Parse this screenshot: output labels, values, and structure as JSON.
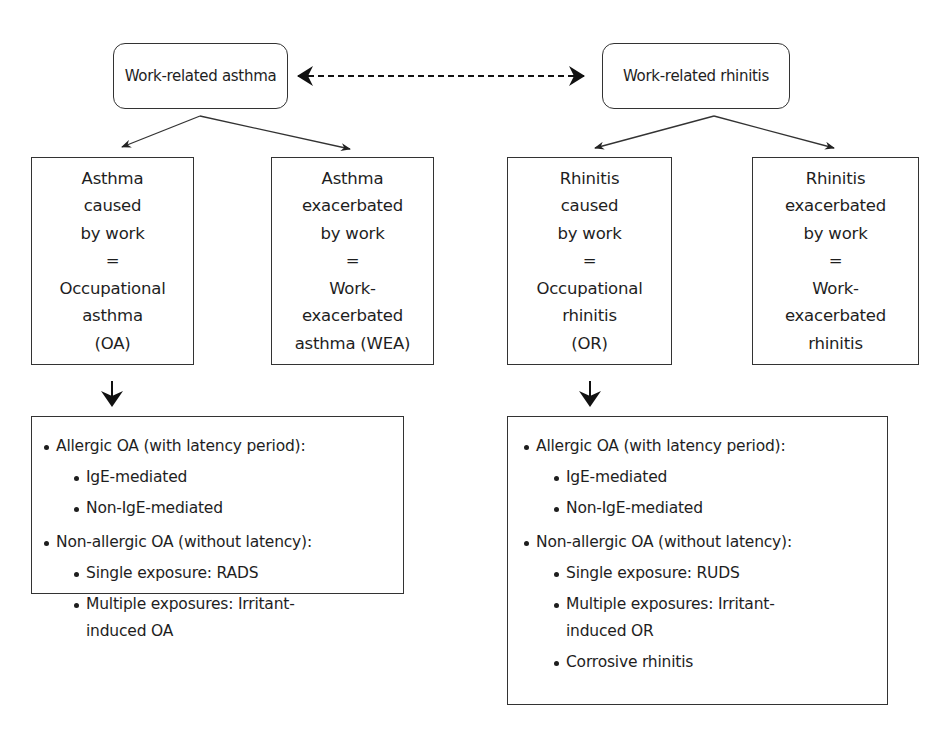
{
  "diagram": {
    "top_nodes": {
      "asthma": "Work-related asthma",
      "rhinitis": "Work-related rhinitis",
      "connector": "bidirectional-dashed-arrow"
    },
    "asthma_branches": {
      "caused": [
        "Asthma",
        "caused",
        "by work",
        "=",
        "Occupational",
        "asthma",
        "(OA)"
      ],
      "exacerbated": [
        "Asthma",
        "exacerbated",
        "by work",
        "=",
        "Work-",
        "exacerbated",
        "asthma (WEA)"
      ]
    },
    "rhinitis_branches": {
      "caused": [
        "Rhinitis",
        "caused",
        "by work",
        "=",
        "Occupational",
        "rhinitis",
        "(OR)"
      ],
      "exacerbated": [
        "Rhinitis",
        "exacerbated",
        "by work",
        "=",
        "Work-",
        "exacerbated",
        "rhinitis"
      ]
    },
    "asthma_subtypes": {
      "allergic": "Allergic OA (with latency period):",
      "allergic_items": [
        "IgE-mediated",
        "Non-IgE-mediated"
      ],
      "nonallergic": "Non-allergic OA (without latency):",
      "nonallergic_items": [
        "Single exposure: RADS",
        "Multiple exposures: Irritant-",
        "induced OA"
      ]
    },
    "rhinitis_subtypes": {
      "allergic": "Allergic OA (with latency period):",
      "allergic_items": [
        "IgE-mediated",
        "Non-IgE-mediated"
      ],
      "nonallergic": "Non-allergic OA (without latency):",
      "nonallergic_items": [
        "Single exposure: RUDS",
        "Multiple exposures: Irritant-",
        "induced OR",
        "Corrosive rhinitis"
      ]
    },
    "colors": {
      "line": "#333333",
      "text": "#1e1e1e",
      "background": "#ffffff"
    }
  }
}
